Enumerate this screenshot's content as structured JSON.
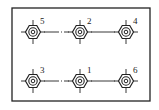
{
  "diagram": {
    "type": "bolt-tightening-sequence",
    "frame": {
      "x": 12,
      "y": 8,
      "width": 138,
      "height": 93
    },
    "stroke_color": "#222222",
    "nuts": [
      {
        "label": "5",
        "cx": 33,
        "cy": 32
      },
      {
        "label": "2",
        "cx": 80,
        "cy": 32
      },
      {
        "label": "4",
        "cx": 126,
        "cy": 32
      },
      {
        "label": "3",
        "cx": 33,
        "cy": 81
      },
      {
        "label": "1",
        "cx": 80,
        "cy": 81
      },
      {
        "label": "6",
        "cx": 126,
        "cy": 81
      }
    ],
    "connectors": [
      {
        "from": "5",
        "to": "2",
        "style": "solid-with-dashdot"
      },
      {
        "from": "2",
        "to": "4",
        "style": "solid"
      },
      {
        "from": "3",
        "to": "1",
        "style": "solid-with-dashdot"
      },
      {
        "from": "1",
        "to": "6",
        "style": "solid"
      }
    ]
  }
}
